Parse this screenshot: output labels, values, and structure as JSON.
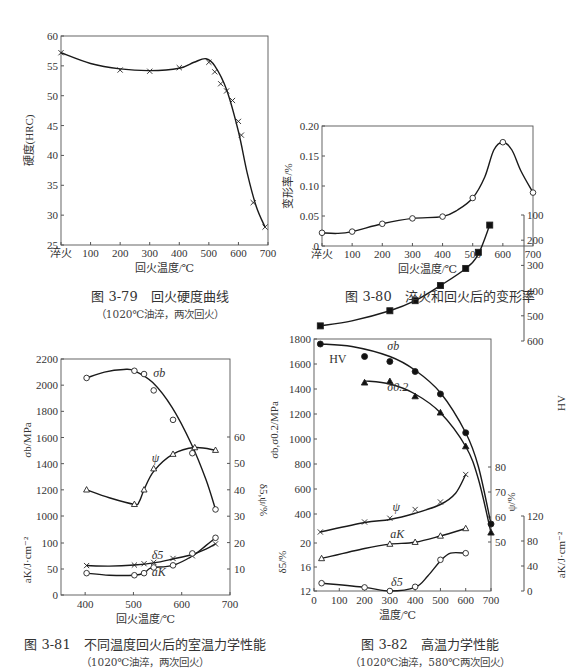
{
  "captions": {
    "fig79": {
      "title": "图 3-79　回火硬度曲线",
      "note": "（1020℃油淬，两次回火）"
    },
    "fig80": {
      "title": "图 3-80　淬火和回火后的变形率"
    },
    "fig81": {
      "title": "图 3-81　不同温度回火后的室温力学性能",
      "note": "（1020℃油淬，两次回火）"
    },
    "fig82": {
      "title": "图 3-82　高温力学性能",
      "note": "（1020℃油淬，580℃两次回火）"
    }
  },
  "chart_data": [
    {
      "id": "fig79",
      "type": "line",
      "title": "回火硬度曲线",
      "xlabel": "回火温度/℃",
      "ylabel": "硬度(HRC)",
      "xticks": [
        "淬火",
        "100",
        "200",
        "300",
        "400",
        "500",
        "600",
        "700"
      ],
      "xlim": [
        0,
        700
      ],
      "ylim": [
        25,
        60
      ],
      "yticks": [
        25,
        30,
        35,
        40,
        45,
        50,
        55,
        60
      ],
      "marker": "x",
      "series": [
        {
          "name": "硬度",
          "x": [
            0,
            200,
            300,
            400,
            500,
            520,
            540,
            560,
            580,
            600,
            610,
            650,
            690
          ],
          "y": [
            57.2,
            54.3,
            54.1,
            54.7,
            55.6,
            54.0,
            52.0,
            50.8,
            49.2,
            45.7,
            43.4,
            32.1,
            28.0
          ]
        }
      ],
      "curve": {
        "x": [
          0,
          100,
          200,
          300,
          400,
          450,
          490,
          520,
          560,
          600,
          630,
          660,
          690
        ],
        "y": [
          57.2,
          55.4,
          54.5,
          54.2,
          54.6,
          55.6,
          56.2,
          55.0,
          51.0,
          44.0,
          37.0,
          31.5,
          28.0
        ]
      }
    },
    {
      "id": "fig80",
      "type": "line",
      "title": "淬火和回火后的变形率",
      "xlabel": "回火温度/℃",
      "ylabel": "变形率/%",
      "xticks": [
        "淬火",
        "100",
        "200",
        "300",
        "400",
        "500",
        "600",
        "700"
      ],
      "xlim": [
        0,
        700
      ],
      "ylim": [
        0,
        0.2
      ],
      "yticks": [
        "0",
        "0.05",
        "0.10",
        "0.15",
        "0.20"
      ],
      "marker": "circle",
      "series": [
        {
          "name": "变形率",
          "x": [
            0,
            100,
            200,
            300,
            400,
            500,
            600,
            700
          ],
          "y": [
            0.022,
            0.024,
            0.037,
            0.046,
            0.049,
            0.08,
            0.173,
            0.089
          ]
        }
      ],
      "curve": {
        "x": [
          0,
          50,
          100,
          200,
          300,
          400,
          450,
          500,
          540,
          570,
          600,
          630,
          660,
          700
        ],
        "y": [
          0.022,
          0.021,
          0.024,
          0.037,
          0.046,
          0.049,
          0.06,
          0.08,
          0.115,
          0.16,
          0.173,
          0.16,
          0.125,
          0.089
        ]
      }
    },
    {
      "id": "fig81",
      "type": "line",
      "title": "不同温度回火后的室温力学性能",
      "xlabel": "回火温度/℃",
      "ylabel_left_top": "σb/MPa",
      "ylabel_left_bottom": "aK/J·cm⁻²",
      "ylabel_right": "δ5,ψ/%",
      "xticks": [
        400,
        500,
        600,
        700
      ],
      "xlim": [
        350,
        700
      ],
      "yticks_left": [
        "0",
        "50",
        "100",
        "1000",
        "1200",
        "1400",
        "1600",
        "1800",
        "2000",
        "2200"
      ],
      "yticks_right": [
        10,
        20,
        30,
        40,
        50,
        60
      ],
      "series": [
        {
          "name": "σb",
          "marker": "circle",
          "axis": "MPa",
          "x": [
            403,
            502,
            522,
            542,
            582,
            622,
            670
          ],
          "y": [
            2055,
            2110,
            2085,
            1960,
            1735,
            1480,
            1050
          ]
        },
        {
          "name": "ψ",
          "marker": "triangle",
          "axis": "%",
          "x": [
            403,
            502,
            522,
            542,
            582,
            627,
            670
          ],
          "y": [
            40,
            34.5,
            40,
            48,
            53.5,
            56,
            55
          ]
        },
        {
          "name": "δ5",
          "marker": "x",
          "axis": "%",
          "x": [
            403,
            502,
            522,
            542,
            582,
            622,
            670
          ],
          "y": [
            11.3,
            11.5,
            12,
            12.5,
            14,
            15,
            19.5
          ]
        },
        {
          "name": "aK",
          "marker": "circle",
          "axis": "J",
          "x": [
            403,
            502,
            522,
            542,
            582,
            622,
            670
          ],
          "y": [
            42,
            38,
            42,
            53,
            57,
            80,
            110
          ]
        }
      ]
    },
    {
      "id": "fig82",
      "type": "line",
      "title": "高温力学性能",
      "xlabel": "温度/℃",
      "ylabel_left_top": "σb,σ0.2/MPa",
      "ylabel_left_bottom": "δ5/%",
      "ylabel_right_hv": "HV",
      "ylabel_right_psi": "ψ/%",
      "ylabel_right_ak": "aK/J·cm⁻²",
      "xticks": [
        0,
        100,
        200,
        300,
        400,
        500,
        600,
        700
      ],
      "xlim": [
        0,
        700
      ],
      "yticks_left": [
        "12",
        "16",
        "20",
        "400",
        "600",
        "800",
        "1000",
        "1200",
        "1400",
        "1600",
        "1800"
      ],
      "yticks_hv": [
        100,
        200,
        300,
        400,
        500,
        600
      ],
      "yticks_psi": [
        50,
        60,
        70,
        80
      ],
      "yticks_ak": [
        0,
        40,
        80,
        120
      ],
      "series": [
        {
          "name": "σb",
          "marker": "filled-circle",
          "axis": "MPa",
          "x": [
            25,
            200,
            300,
            400,
            500,
            600,
            700
          ],
          "y": [
            1760,
            1660,
            1620,
            1540,
            1360,
            1050,
            320
          ]
        },
        {
          "name": "HV",
          "marker": "filled-square",
          "axis": "HV",
          "x": [
            25,
            300,
            400,
            500,
            600,
            650,
            695
          ],
          "y": [
            540,
            480,
            440,
            380,
            312,
            248,
            140
          ]
        },
        {
          "name": "σ0.2",
          "marker": "filled-triangle",
          "axis": "MPa",
          "x": [
            200,
            300,
            400,
            500,
            600,
            700
          ],
          "y": [
            1450,
            1460,
            1340,
            1210,
            940,
            250
          ]
        },
        {
          "name": "ψ",
          "marker": "x",
          "axis": "psi",
          "x": [
            25,
            200,
            300,
            400,
            500,
            600
          ],
          "y": [
            54,
            58,
            59.5,
            63,
            66,
            77
          ]
        },
        {
          "name": "aK",
          "marker": "triangle",
          "axis": "ak",
          "x": [
            30,
            300,
            400,
            500,
            600
          ],
          "y": [
            52,
            75,
            78,
            88,
            100
          ]
        },
        {
          "name": "δ5",
          "marker": "circle",
          "axis": "delta",
          "x": [
            30,
            200,
            300,
            400,
            500,
            600
          ],
          "y": [
            13.3,
            12.6,
            12.0,
            12.7,
            17.2,
            18.3
          ]
        }
      ]
    }
  ]
}
